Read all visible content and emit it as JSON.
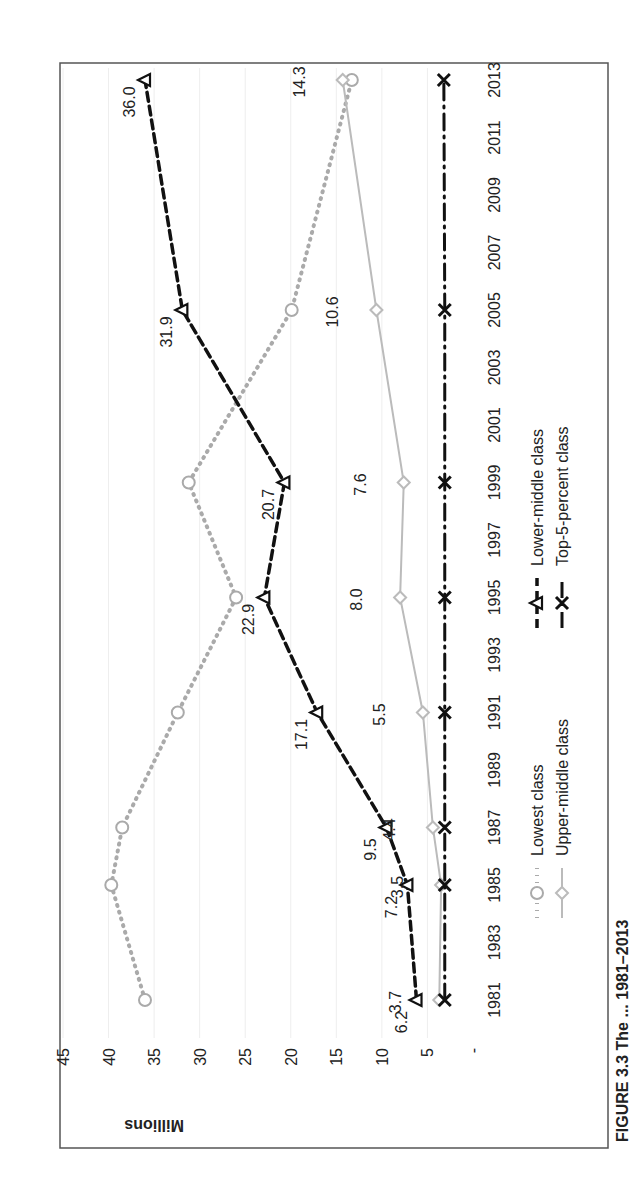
{
  "figure": {
    "caption": "FIGURE 3.3 The ... 1981–2013"
  },
  "chart_data": {
    "type": "line",
    "orientation": "rotated-90-ccw",
    "title": "",
    "xlabel": "",
    "ylabel": "Millions",
    "ylim": [
      0,
      45
    ],
    "yticks": [
      "-",
      "5",
      "10",
      "15",
      "20",
      "25",
      "30",
      "35",
      "40",
      "45"
    ],
    "xticks": [
      "1981",
      "1983",
      "1985",
      "1987",
      "1989",
      "1991",
      "1993",
      "1995",
      "1997",
      "1999",
      "2001",
      "2003",
      "2005",
      "2007",
      "2009",
      "2011",
      "2013"
    ],
    "x": [
      1981,
      1985,
      1987,
      1991,
      1995,
      1999,
      2005,
      2013
    ],
    "grid": true,
    "legend_position": "bottom",
    "series": [
      {
        "name": "Lowest class",
        "values": [
          36.0,
          39.7,
          38.5,
          32.4,
          26.0,
          31.2,
          19.9,
          13.3
        ],
        "labels": [],
        "color": "#aaaaaa",
        "style": "dotted",
        "marker": "circle"
      },
      {
        "name": "Lower-middle class",
        "values": [
          6.2,
          7.2,
          9.5,
          17.1,
          22.9,
          20.7,
          31.9,
          36.0
        ],
        "labels": [
          "6.2",
          "7.2",
          "9.5",
          "17.1",
          "22.9",
          "20.7",
          "31.9",
          "36.0"
        ],
        "color": "#111111",
        "style": "dashed",
        "marker": "triangle"
      },
      {
        "name": "Upper-middle class",
        "values": [
          3.7,
          3.5,
          4.4,
          5.5,
          8.0,
          7.6,
          10.6,
          14.3
        ],
        "labels": [
          "3.7",
          "3.5",
          "4.4",
          "5.5",
          "8.0",
          "7.6",
          "10.6",
          "14.3"
        ],
        "color": "#bbbbbb",
        "style": "solid",
        "marker": "diamond"
      },
      {
        "name": "Top-5-percent class",
        "values": [
          3.1,
          3.1,
          3.1,
          3.1,
          3.1,
          3.1,
          3.1,
          3.2
        ],
        "labels": [],
        "color": "#111111",
        "style": "dash-dot",
        "marker": "x"
      }
    ]
  }
}
